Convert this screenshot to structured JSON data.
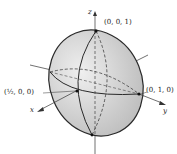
{
  "diagram": {
    "type": "ellipsoid",
    "axes": {
      "x": "x",
      "y": "y",
      "z": "z"
    },
    "points": {
      "top": "(0, 0, 1)",
      "front": "(½, 0, 0)",
      "right": "(0, 1, 0)"
    },
    "colors": {
      "fill": "#d4d4d4",
      "stroke": "#2a2a2a",
      "axis": "#333333"
    }
  }
}
